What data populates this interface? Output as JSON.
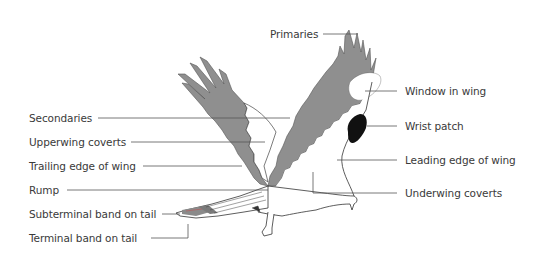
{
  "diagram": {
    "colors": {
      "wing_gray": "#8f8f8f",
      "wrist_patch": "#111111",
      "outline": "#333333",
      "leader_line": "#555555",
      "label_text": "#3a3a3a",
      "background": "#ffffff"
    },
    "labels_left": [
      {
        "id": "secondaries",
        "text": "Secondaries",
        "x": 29,
        "y": 112
      },
      {
        "id": "upperwing-coverts",
        "text": "Upperwing coverts",
        "x": 29,
        "y": 136
      },
      {
        "id": "trailing-edge",
        "text": "Trailing edge of wing",
        "x": 29,
        "y": 160
      },
      {
        "id": "rump",
        "text": "Rump",
        "x": 29,
        "y": 184
      },
      {
        "id": "subterminal-band",
        "text": "Subterminal band on tail",
        "x": 29,
        "y": 208
      },
      {
        "id": "terminal-band",
        "text": "Terminal band on tail",
        "x": 29,
        "y": 232
      }
    ],
    "labels_right": [
      {
        "id": "primaries",
        "text": "Primaries",
        "x": 270,
        "y": 29
      },
      {
        "id": "window-in-wing",
        "text": "Window in wing",
        "x": 405,
        "y": 86
      },
      {
        "id": "wrist-patch",
        "text": "Wrist patch",
        "x": 405,
        "y": 121
      },
      {
        "id": "leading-edge",
        "text": "Leading edge of wing",
        "x": 405,
        "y": 155
      },
      {
        "id": "underwing-coverts",
        "text": "Underwing coverts",
        "x": 405,
        "y": 188
      }
    ]
  }
}
